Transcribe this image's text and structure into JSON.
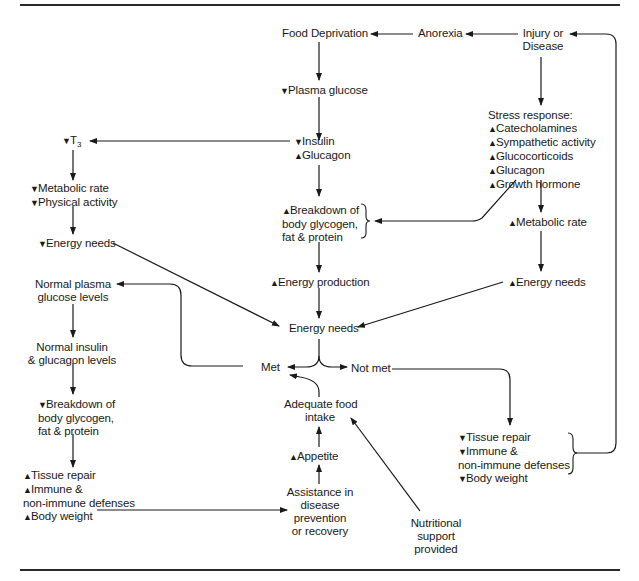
{
  "diagram": {
    "type": "flowchart",
    "topic": "Malnutrition and energy needs cycle in injury or disease",
    "arrow_up": "▲",
    "arrow_down": "▼",
    "nodes": {
      "food_deprivation": {
        "lines": [
          "Food Deprivation"
        ]
      },
      "anorexia": {
        "lines": [
          "Anorexia"
        ]
      },
      "injury_disease": {
        "lines": [
          "Injury or",
          "Disease"
        ]
      },
      "plasma_glucose": {
        "dir": "down",
        "lines": [
          "Plasma glucose"
        ]
      },
      "stress_response": {
        "title": "Stress response:",
        "items": [
          {
            "dir": "up",
            "text": "Catecholamines"
          },
          {
            "dir": "up",
            "text": "Sympathetic activity"
          },
          {
            "dir": "up",
            "text": "Glucocorticoids"
          },
          {
            "dir": "up",
            "text": "Glucagon"
          },
          {
            "dir": "up",
            "text": "Growth hormone"
          }
        ]
      },
      "t3": {
        "dir": "down",
        "text": "T",
        "sub": "3"
      },
      "insulin_glucagon": {
        "items": [
          {
            "dir": "down",
            "text": "Insulin"
          },
          {
            "dir": "up",
            "text": "Glucagon"
          }
        ]
      },
      "metabolic_physical": {
        "items": [
          {
            "dir": "down",
            "text": "Metabolic rate"
          },
          {
            "dir": "down",
            "text": "Physical activity"
          }
        ]
      },
      "breakdown_up": {
        "dir": "up",
        "lines": [
          "Breakdown of",
          "body glycogen,",
          "fat & protein"
        ]
      },
      "metabolic_rate_up": {
        "dir": "up",
        "lines": [
          "Metabolic rate"
        ]
      },
      "energy_needs_down": {
        "dir": "down",
        "lines": [
          "Energy needs"
        ]
      },
      "energy_production_up": {
        "dir": "up",
        "lines": [
          "Energy production"
        ]
      },
      "energy_needs_up": {
        "dir": "up",
        "lines": [
          "Energy needs"
        ]
      },
      "normal_plasma": {
        "lines": [
          "Normal plasma",
          "glucose levels"
        ]
      },
      "energy_needs_center": {
        "lines": [
          "Energy needs"
        ]
      },
      "normal_insulin": {
        "lines": [
          "Normal insulin",
          "& glucagon levels"
        ]
      },
      "met": {
        "lines": [
          "Met"
        ]
      },
      "not_met": {
        "lines": [
          "Not met"
        ]
      },
      "breakdown_down": {
        "dir": "down",
        "lines": [
          "Breakdown of",
          "body glycogen,",
          "fat & protein"
        ]
      },
      "adequate_food": {
        "lines": [
          "Adequate food",
          "intake"
        ]
      },
      "tissue_repair_down": {
        "items": [
          {
            "dir": "down",
            "text": "Tissue repair"
          },
          {
            "dir": "down",
            "text": "Immune &"
          },
          {
            "dir": null,
            "text": "non-immune defenses"
          },
          {
            "dir": "down",
            "text": "Body weight"
          }
        ]
      },
      "appetite": {
        "dir": "up",
        "lines": [
          "Appetite"
        ]
      },
      "tissue_repair_up": {
        "items": [
          {
            "dir": "up",
            "text": "Tissue repair"
          },
          {
            "dir": "up",
            "text": "Immune &"
          },
          {
            "dir": null,
            "text": "non-immune defenses"
          },
          {
            "dir": "up",
            "text": "Body weight"
          }
        ]
      },
      "assistance": {
        "lines": [
          "Assistance in",
          "disease",
          "prevention",
          "or recovery"
        ]
      },
      "nutritional_support": {
        "lines": [
          "Nutritional",
          "support",
          "provided"
        ]
      }
    },
    "edges": [
      [
        "anorexia",
        "food_deprivation"
      ],
      [
        "injury_disease",
        "anorexia"
      ],
      [
        "food_deprivation",
        "plasma_glucose"
      ],
      [
        "injury_disease",
        "stress_response"
      ],
      [
        "plasma_glucose",
        "insulin_glucagon"
      ],
      [
        "insulin_glucagon",
        "t3"
      ],
      [
        "t3",
        "metabolic_physical"
      ],
      [
        "metabolic_physical",
        "energy_needs_down"
      ],
      [
        "insulin_glucagon",
        "breakdown_up"
      ],
      [
        "stress_response",
        "breakdown_up"
      ],
      [
        "stress_response",
        "metabolic_rate_up"
      ],
      [
        "metabolic_rate_up",
        "energy_needs_up"
      ],
      [
        "breakdown_up",
        "energy_production_up"
      ],
      [
        "energy_production_up",
        "energy_needs_center"
      ],
      [
        "energy_needs_down",
        "energy_needs_center"
      ],
      [
        "energy_needs_up",
        "energy_needs_center"
      ],
      [
        "energy_needs_center",
        "met"
      ],
      [
        "energy_needs_center",
        "not_met"
      ],
      [
        "met",
        "normal_plasma"
      ],
      [
        "normal_plasma",
        "normal_insulin"
      ],
      [
        "normal_insulin",
        "breakdown_down"
      ],
      [
        "breakdown_down",
        "tissue_repair_up"
      ],
      [
        "tissue_repair_up",
        "assistance"
      ],
      [
        "assistance",
        "appetite"
      ],
      [
        "appetite",
        "adequate_food"
      ],
      [
        "adequate_food",
        "met"
      ],
      [
        "nutritional_support",
        "adequate_food"
      ],
      [
        "not_met",
        "tissue_repair_down"
      ],
      [
        "tissue_repair_down",
        "injury_disease"
      ]
    ],
    "colors": {
      "ink": "#1a1a1a",
      "background": "#ffffff"
    }
  }
}
